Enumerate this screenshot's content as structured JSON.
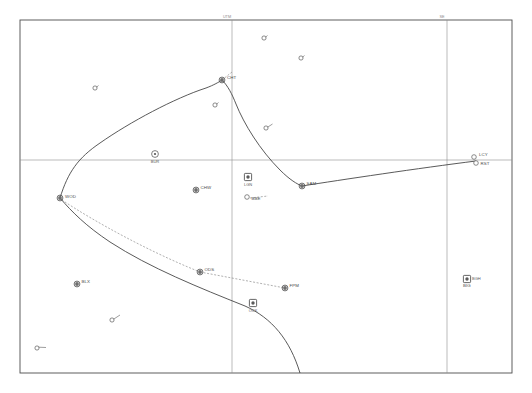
{
  "chart_data": {
    "type": "scatter",
    "title": "",
    "xlabel": "",
    "ylabel": "",
    "grid": true,
    "legend_position": "none",
    "xlim": [
      0,
      532
    ],
    "ylim": [
      0,
      393
    ],
    "frame": {
      "left": 20,
      "top": 20,
      "right": 512,
      "bottom": 373
    },
    "gridlines": [
      {
        "name": "meridian-1",
        "orientation": "vertical",
        "x": 232,
        "label": "UTM"
      },
      {
        "name": "meridian-2",
        "orientation": "vertical",
        "x": 447,
        "label": "SE"
      },
      {
        "name": "parallel-1",
        "orientation": "horizontal",
        "y": 160,
        "label": ""
      }
    ],
    "waypoints": [
      {
        "id": "CHT",
        "label": "CHT",
        "x": 222,
        "y": 80,
        "symbol": "filled-ring",
        "label_dx": 5,
        "label_dy": -1.5
      },
      {
        "id": "BUR",
        "label": "BUR",
        "x": 155,
        "y": 154,
        "symbol": "ring-dot",
        "label_dx": 0,
        "label_dy": 8.5,
        "label_anchor": "middle"
      },
      {
        "id": "WOD",
        "label": "WOD",
        "x": 60,
        "y": 198,
        "symbol": "filled-ring",
        "label_dx": 5,
        "label_dy": -0.5
      },
      {
        "id": "CHW",
        "label": "CHW",
        "x": 196,
        "y": 190,
        "symbol": "filled-ring",
        "label_dx": 4.5,
        "label_dy": -1.5
      },
      {
        "id": "LGN",
        "label": "LGN",
        "x": 248,
        "y": 177,
        "symbol": "square-dot",
        "label_dx": -4,
        "label_dy": 8.5
      },
      {
        "id": "BBE",
        "label": "BBE",
        "x": 247,
        "y": 197,
        "symbol": "open",
        "label_dx": 4.5,
        "label_dy": 2.5
      },
      {
        "id": "SAM",
        "label": "SAM",
        "x": 302,
        "y": 186,
        "symbol": "filled-ring",
        "label_dx": 4.5,
        "label_dy": -1.0
      },
      {
        "id": "LCY",
        "label": "LCY",
        "x": 474,
        "y": 157,
        "symbol": "open",
        "label_dx": 5,
        "label_dy": -1.5
      },
      {
        "id": "RST",
        "label": "RST",
        "x": 476,
        "y": 163,
        "symbol": "open",
        "label_dx": 4.5,
        "label_dy": 1.5
      },
      {
        "id": "BGH",
        "label": "BGH",
        "x": 467,
        "y": 279,
        "symbol": "square-dot",
        "label_dx": 5,
        "label_dy": 1.0
      },
      {
        "id": "BIG",
        "label": "BIG",
        "x": 467,
        "y": 279,
        "symbol": "none",
        "label_dx": -4,
        "label_dy": 8.0
      },
      {
        "id": "ODS",
        "label": "ODS",
        "x": 200,
        "y": 272,
        "symbol": "filled-ring",
        "label_dx": 4.5,
        "label_dy": -1.0
      },
      {
        "id": "FPM",
        "label": "FPM",
        "x": 285,
        "y": 288,
        "symbol": "filled-ring",
        "label_dx": 4.5,
        "label_dy": -1.0
      },
      {
        "id": "OCK",
        "label": "OCK",
        "x": 253,
        "y": 303,
        "symbol": "square-dot",
        "label_dx": 0,
        "label_dy": 9.0,
        "label_anchor": "middle"
      },
      {
        "id": "BLX",
        "label": "BLX",
        "x": 77,
        "y": 284,
        "symbol": "filled-ring",
        "label_dx": 4.5,
        "label_dy": -1.0
      }
    ],
    "minor_points": [
      {
        "id": "mp-1",
        "x": 264,
        "y": 38,
        "tick_dx": 3.5,
        "tick_dy": -2.5
      },
      {
        "id": "mp-2",
        "x": 301,
        "y": 58,
        "tick_dx": 3.5,
        "tick_dy": -2.5
      },
      {
        "id": "mp-3",
        "x": 95,
        "y": 88,
        "tick_dx": 3.5,
        "tick_dy": -2.5
      },
      {
        "id": "mp-4",
        "x": 215,
        "y": 105,
        "tick_dx": 3.5,
        "tick_dy": -2.5
      },
      {
        "id": "mp-5",
        "x": 266,
        "y": 128,
        "tick_dx": 6.5,
        "tick_dy": -4.0
      },
      {
        "id": "mp-6",
        "x": 112,
        "y": 320,
        "tick_dx": 8.0,
        "tick_dy": -5.0
      },
      {
        "id": "mp-7",
        "x": 37,
        "y": 348,
        "tick_dx": 9.0,
        "tick_dy": -0.5
      }
    ],
    "route_solid": [
      {
        "name": "track-west",
        "d": "M 60 198 C 68 172 78 158 100 143 C 130 122 175 98 206 88 C 214 85 219 82 222 80"
      },
      {
        "name": "track-cht-sam",
        "d": "M 222 80 C 228 86 232 94 236 104 C 244 124 260 150 280 170 C 290 180 297 184 302 186"
      },
      {
        "name": "track-sam-rst",
        "d": "M 302 186 C 340 180 420 168 476 161"
      },
      {
        "name": "track-south",
        "d": "M 60 198 C 72 212 86 226 110 242 C 150 268 200 288 245 306 C 272 318 290 340 300 373"
      }
    ],
    "route_dashed": [
      {
        "name": "dashed-wod-odd",
        "d": "M 62 200 C 95 222 150 252 200 272"
      },
      {
        "name": "dashed-ods-fpm",
        "d": "M 200 272 L 285 288"
      },
      {
        "name": "dashed-cht-top",
        "d": "M 222 80 L 232 72"
      },
      {
        "name": "dashed-bbe",
        "d": "M 250 198 L 268 196"
      }
    ]
  }
}
